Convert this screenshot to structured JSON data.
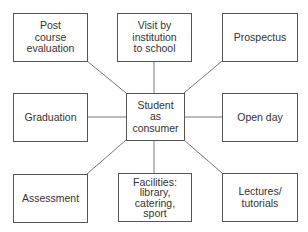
{
  "diagram": {
    "center": {
      "label": "Student\nas\nconsumer"
    },
    "nodes": [
      {
        "id": "post-course-evaluation",
        "label": "Post\ncourse\nevaluation"
      },
      {
        "id": "visit-by-institution",
        "label": "Visit by\ninstitution\nto school"
      },
      {
        "id": "prospectus",
        "label": "Prospectus"
      },
      {
        "id": "graduation",
        "label": "Graduation"
      },
      {
        "id": "open-day",
        "label": "Open day"
      },
      {
        "id": "assessment",
        "label": "Assessment"
      },
      {
        "id": "facilities",
        "label": "Facilities:\nlibrary,\ncatering,\nsport"
      },
      {
        "id": "lectures-tutorials",
        "label": "Lectures/\ntutorials"
      }
    ]
  }
}
